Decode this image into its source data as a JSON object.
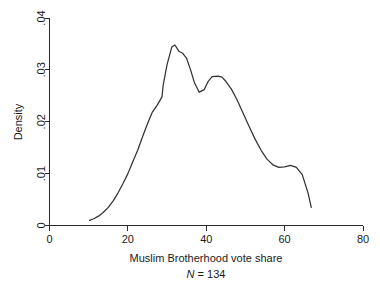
{
  "chart_data": {
    "type": "line",
    "title": "",
    "subtitle": "",
    "xlabel": "Muslim Brotherhood vote share",
    "ylabel": "Density",
    "annotation": "N = 134",
    "annotation_symbol": "N",
    "annotation_value": "= 134",
    "sample_size": 134,
    "grid": false,
    "legend": "none",
    "xlim": [
      0,
      80
    ],
    "ylim": [
      0,
      0.04
    ],
    "xticks": [
      0,
      20,
      40,
      60,
      80
    ],
    "xtick_labels": [
      "0",
      "20",
      "40",
      "60",
      "80"
    ],
    "yticks": [
      0,
      0.01,
      0.02,
      0.03,
      0.04
    ],
    "ytick_labels": [
      "0",
      ".01",
      ".02",
      ".03",
      ".04"
    ],
    "series": [
      {
        "name": "Kernel density",
        "color": "#333333",
        "x": [
          10.2,
          11.3,
          12.5,
          13.7,
          15.0,
          16.3,
          17.5,
          18.7,
          20.0,
          21.2,
          22.5,
          23.7,
          25.0,
          26.2,
          27.5,
          28.7,
          29.0,
          30.0,
          31.2,
          32.0,
          33.0,
          34.0,
          35.0,
          36.0,
          37.0,
          38.2,
          39.5,
          40.5,
          41.5,
          43.0,
          44.0,
          45.0,
          46.5,
          48.0,
          49.5,
          51.0,
          52.5,
          54.0,
          55.5,
          57.0,
          58.5,
          60.0,
          61.5,
          63.0,
          64.5,
          66.0,
          66.8
        ],
        "y": [
          0.001,
          0.0013,
          0.0018,
          0.0025,
          0.0035,
          0.0048,
          0.0063,
          0.008,
          0.01,
          0.0122,
          0.0145,
          0.017,
          0.0196,
          0.0218,
          0.0232,
          0.0248,
          0.027,
          0.031,
          0.0344,
          0.0348,
          0.0336,
          0.0332,
          0.0322,
          0.03,
          0.0275,
          0.0257,
          0.0262,
          0.0278,
          0.0287,
          0.0288,
          0.0286,
          0.0278,
          0.0262,
          0.024,
          0.0215,
          0.019,
          0.0166,
          0.0145,
          0.0128,
          0.0117,
          0.0112,
          0.0113,
          0.0116,
          0.0112,
          0.0098,
          0.0062,
          0.0035
        ]
      }
    ]
  },
  "axes": {
    "y_title": "Density",
    "x_title": "Muslim Brotherhood vote share"
  }
}
